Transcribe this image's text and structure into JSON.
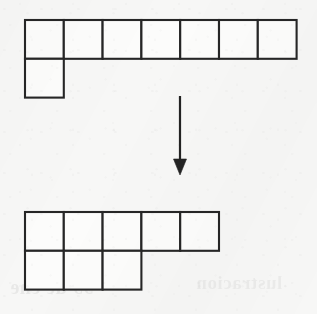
{
  "figure": {
    "description": "An 8-square polyomino shown before and after rearrangement, linked by a downward arrow.",
    "canvas": {
      "width": 317,
      "height": 314
    },
    "background_color": "#f7f7f6",
    "line_color": "#262626",
    "cell_fill_color": "#fcfcfb",
    "line_width": 2.1,
    "cell_size": 38.8
  },
  "shapes": [
    {
      "id": "shape-before",
      "name": "before-shape",
      "label": "Before",
      "origin_x": 25,
      "origin_y": 20,
      "cell_size": 38.8,
      "total_cells": 8,
      "rows": [
        {
          "row_index": 0,
          "cell_count": 7,
          "start_column": 0
        },
        {
          "row_index": 1,
          "cell_count": 1,
          "start_column": 0
        }
      ],
      "cells": [
        {
          "col": 0,
          "row": 0
        },
        {
          "col": 1,
          "row": 0
        },
        {
          "col": 2,
          "row": 0
        },
        {
          "col": 3,
          "row": 0
        },
        {
          "col": 4,
          "row": 0
        },
        {
          "col": 5,
          "row": 0
        },
        {
          "col": 6,
          "row": 0
        },
        {
          "col": 0,
          "row": 1
        }
      ]
    },
    {
      "id": "shape-after",
      "name": "after-shape",
      "label": "After",
      "origin_x": 25,
      "origin_y": 212,
      "cell_size": 38.8,
      "total_cells": 8,
      "rows": [
        {
          "row_index": 0,
          "cell_count": 5,
          "start_column": 0
        },
        {
          "row_index": 1,
          "cell_count": 3,
          "start_column": 0
        }
      ],
      "cells": [
        {
          "col": 0,
          "row": 0
        },
        {
          "col": 1,
          "row": 0
        },
        {
          "col": 2,
          "row": 0
        },
        {
          "col": 3,
          "row": 0
        },
        {
          "col": 4,
          "row": 0
        },
        {
          "col": 0,
          "row": 1
        },
        {
          "col": 1,
          "row": 1
        },
        {
          "col": 2,
          "row": 1
        }
      ]
    }
  ],
  "arrow": {
    "name": "transformation-arrow",
    "direction": "down",
    "x": 180,
    "y_start": 96,
    "y_end": 175,
    "shaft_width": 2.2,
    "head_width": 13,
    "head_length": 16,
    "color": "#232323"
  },
  "bleed_through_text": {
    "lower_left": "99 de ene",
    "lower_right": "lustracion"
  }
}
